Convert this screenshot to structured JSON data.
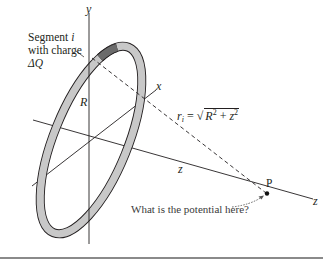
{
  "figure": {
    "segment_label": {
      "line1": "Segment i",
      "line1_text": "Segment ",
      "line1_var": "i",
      "line2": "with charge",
      "line3": "ΔQ"
    },
    "axes": {
      "y": "y",
      "x": "x",
      "z_mid": "z",
      "z_end": "z"
    },
    "radius_label": "R",
    "point_label": "P",
    "distance_formula": {
      "lhs_var": "r",
      "lhs_sub": "i",
      "equals": " = ",
      "radical": "√",
      "R": "R",
      "R_exp": "2",
      "plus": " + ",
      "z": "z",
      "z_exp": "2",
      "full": "r_i = √(R² + z²)"
    },
    "question": "What is the potential here?",
    "colors": {
      "ring_fill": "#c8c8c8",
      "ring_stroke": "#231f20",
      "segment_fill": "#6b6b6b",
      "axis": "#231f20",
      "dashed_line": "#231f20",
      "caption_arrow": "#555555",
      "bottom_rule": "#8a8a8a"
    }
  }
}
